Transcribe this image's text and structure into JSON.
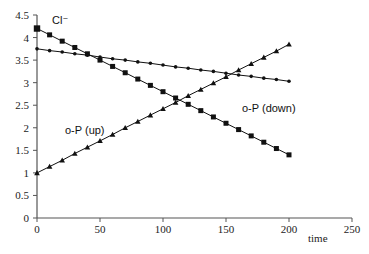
{
  "chart_data": {
    "type": "line",
    "title": "",
    "xlabel": "time",
    "ylabel": "",
    "xlim": [
      0,
      250
    ],
    "ylim": [
      0,
      4.5
    ],
    "x_ticks": [
      0,
      50,
      100,
      150,
      200,
      250
    ],
    "y_ticks": [
      0,
      0.5,
      1,
      1.5,
      2,
      2.5,
      3,
      3.5,
      4,
      4.5
    ],
    "grid": false,
    "legend": "none (inline annotations)",
    "x": [
      0,
      10,
      20,
      30,
      40,
      50,
      60,
      70,
      80,
      90,
      100,
      110,
      120,
      130,
      140,
      150,
      160,
      170,
      180,
      190,
      200
    ],
    "series": [
      {
        "name": "Cl⁻",
        "marker": "square",
        "values": [
          4.2,
          4.06,
          3.92,
          3.78,
          3.64,
          3.5,
          3.36,
          3.22,
          3.08,
          2.94,
          2.8,
          2.66,
          2.52,
          2.38,
          2.24,
          2.1,
          1.96,
          1.82,
          1.68,
          1.54,
          1.4
        ]
      },
      {
        "name": "o-P (down)",
        "marker": "diamond",
        "values": [
          3.75,
          3.71,
          3.68,
          3.64,
          3.61,
          3.57,
          3.53,
          3.5,
          3.46,
          3.43,
          3.39,
          3.35,
          3.32,
          3.28,
          3.25,
          3.21,
          3.17,
          3.14,
          3.1,
          3.07,
          3.03
        ]
      },
      {
        "name": "o-P (up)",
        "marker": "triangle",
        "values": [
          1.0,
          1.14,
          1.28,
          1.43,
          1.57,
          1.71,
          1.85,
          2.0,
          2.14,
          2.28,
          2.42,
          2.56,
          2.71,
          2.85,
          2.99,
          3.13,
          3.28,
          3.42,
          3.56,
          3.7,
          3.85
        ]
      }
    ],
    "annotations": [
      {
        "text": "Cl⁻",
        "x": 13,
        "y": 4.35
      },
      {
        "text": "o-P (down)",
        "x": 163,
        "y": 2.45
      },
      {
        "text": "o-P (up)",
        "x": 45,
        "y": 1.95
      }
    ]
  },
  "labels": {
    "xlabel": "time",
    "cl": "Cl⁻",
    "op_down": "o-P (down)",
    "op_up": "o-P (up)"
  },
  "colors": {
    "line": "#111111",
    "axis": "#555555"
  }
}
